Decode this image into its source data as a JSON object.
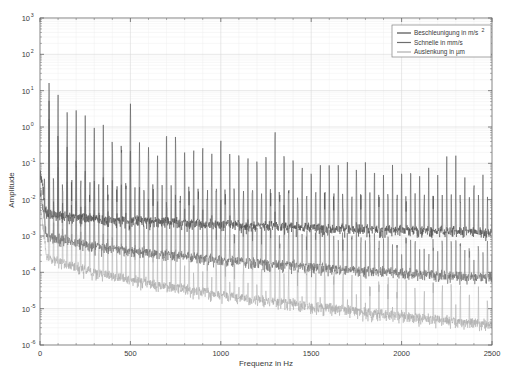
{
  "chart_data": {
    "type": "line",
    "title": "",
    "xlabel": "Frequenz in Hz",
    "ylabel": "Amplitude",
    "xlim": [
      0,
      2500
    ],
    "ylim": [
      1e-06,
      1000
    ],
    "yscale": "log",
    "xscale": "linear",
    "grid": true,
    "grid_minor": true,
    "legend_position": "top-right",
    "xticks": [
      0,
      500,
      1000,
      1500,
      2000,
      2500
    ],
    "xticklabels": [
      "0",
      "500",
      "1000",
      "1500",
      "2000",
      "2500"
    ],
    "yticks": [
      1000,
      100,
      10,
      1,
      0.1,
      0.01,
      0.001,
      0.0001,
      1e-05,
      1e-06
    ],
    "yticklabels": [
      "10³",
      "10²",
      "10¹",
      "10⁰",
      "10⁻¹",
      "10⁻²",
      "10⁻³",
      "10⁻⁴",
      "10⁻⁵",
      "10⁻⁶"
    ],
    "ytick_mantissa": "10",
    "ytick_exponents": [
      "3",
      "2",
      "1",
      "0",
      "-1",
      "-2",
      "-3",
      "-4",
      "-5",
      "-6"
    ],
    "series": [
      {
        "name": "Beschleunigung in m/s²",
        "color": "#4d4d4d",
        "noise_floor_start": 0.004,
        "noise_floor_end": 0.0011,
        "peak_scale": 1.0,
        "harmonic_spacing": 50,
        "fundamental_amplitude": 11.0,
        "decay_exponent": 1.0
      },
      {
        "name": "Schnelle in mm/s",
        "color": "#6e6e6e",
        "noise_floor_start": 0.0012,
        "noise_floor_end": 6e-05,
        "peak_scale": 0.32,
        "harmonic_spacing": 50,
        "fundamental_amplitude": 3.5,
        "decay_exponent": 2.0
      },
      {
        "name": "Auslenkung in µm",
        "color": "#adadad",
        "noise_floor_start": 0.0004,
        "noise_floor_end": 3.2e-06,
        "peak_scale": 0.1,
        "harmonic_spacing": 50,
        "fundamental_amplitude": 1.1,
        "decay_exponent": 3.0
      }
    ],
    "notable_peaks": [
      {
        "freq": 50,
        "amplitude": 11.0,
        "series": "Beschleunigung in m/s²"
      },
      {
        "freq": 100,
        "amplitude": 3.0,
        "series": "Beschleunigung in m/s²"
      },
      {
        "freq": 150,
        "amplitude": 1.1,
        "series": "Beschleunigung in m/s²"
      },
      {
        "freq": 200,
        "amplitude": 0.55,
        "series": "Beschleunigung in m/s²"
      },
      {
        "freq": 250,
        "amplitude": 0.28,
        "series": "Beschleunigung in m/s²"
      },
      {
        "freq": 300,
        "amplitude": 0.18,
        "series": "Beschleunigung in m/s²"
      },
      {
        "freq": 350,
        "amplitude": 0.13,
        "series": "Beschleunigung in m/s²"
      },
      {
        "freq": 400,
        "amplitude": 0.12,
        "series": "Beschleunigung in m/s²"
      },
      {
        "freq": 450,
        "amplitude": 0.1,
        "series": "Beschleunigung in m/s²"
      },
      {
        "freq": 500,
        "amplitude": 1.3,
        "series": "Beschleunigung in m/s²"
      },
      {
        "freq": 1000,
        "amplitude": 0.1,
        "series": "Beschleunigung in m/s²"
      },
      {
        "freq": 1300,
        "amplitude": 0.17,
        "series": "Beschleunigung in m/s²"
      },
      {
        "freq": 2250,
        "amplitude": 0.022,
        "series": "Beschleunigung in m/s²"
      }
    ]
  },
  "legend": {
    "items": [
      {
        "label": "Beschleunigung in m/s",
        "sup": "2"
      },
      {
        "label": "Schnelle in mm/s",
        "sup": ""
      },
      {
        "label": "Auslenkung in µm",
        "sup": ""
      }
    ]
  },
  "axes": {
    "xlabel": "Frequenz in Hz",
    "ylabel": "Amplitude"
  }
}
